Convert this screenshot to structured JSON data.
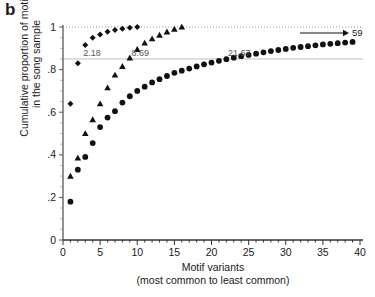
{
  "panel": {
    "label": "b"
  },
  "axes": {
    "ylabel_line1": "Cumulative proportion of motifs",
    "ylabel_line2": "in the song sample",
    "xlabel_line1": "Motif variants",
    "xlabel_line2": "(most common to least common)",
    "y_ticks": [
      "0",
      ".2",
      ".4",
      ".6",
      ".8",
      "1"
    ],
    "x_ticks": [
      "0",
      "5",
      "10",
      "15",
      "20",
      "25",
      "30",
      "35",
      "40"
    ]
  },
  "annotations": {
    "a1": "2.18",
    "a2": "8.69",
    "a3": "21.67",
    "arrow_label": "59"
  },
  "chart_data": {
    "type": "scatter",
    "title": "",
    "xlabel": "Motif variants (most common to least common)",
    "ylabel": "Cumulative proportion of motifs in the song sample",
    "xlim": [
      0,
      40
    ],
    "ylim": [
      0,
      1
    ],
    "x_major_ticks": [
      0,
      5,
      10,
      15,
      20,
      25,
      30,
      35,
      40
    ],
    "x_minor_tick_step": 1,
    "y_major_ticks": [
      0,
      0.2,
      0.4,
      0.6,
      0.8,
      1
    ],
    "grid": {
      "dotted_line_y": 1,
      "reference_line_y": 0.85
    },
    "legend": {
      "visible": false,
      "position": "none"
    },
    "annotations": [
      {
        "text": "2.18",
        "x": 2.18,
        "y": 0.85,
        "note": "variants needed to reach 85% cumulative, series 1"
      },
      {
        "text": "8.69",
        "x": 8.69,
        "y": 0.85,
        "note": "variants needed to reach 85% cumulative, series 2"
      },
      {
        "text": "21.67",
        "x": 21.67,
        "y": 0.85,
        "note": "variants needed to reach 85% cumulative, series 3"
      },
      {
        "text": "59",
        "x": 40,
        "y": 0.975,
        "note": "arrow pointing right, off-scale endpoint of series 3"
      }
    ],
    "series": [
      {
        "name": "Series 1",
        "marker": "diamond",
        "color": "#111111",
        "x": [
          1,
          2,
          3,
          4,
          5,
          6,
          7,
          8,
          9,
          10
        ],
        "y": [
          0.64,
          0.83,
          0.915,
          0.95,
          0.965,
          0.978,
          0.986,
          0.992,
          0.997,
          1.0
        ]
      },
      {
        "name": "Series 2",
        "marker": "triangle",
        "color": "#111111",
        "x": [
          1,
          2,
          3,
          4,
          5,
          6,
          7,
          8,
          9,
          10,
          11,
          12,
          13,
          14,
          15,
          16
        ],
        "y": [
          0.3,
          0.385,
          0.5,
          0.565,
          0.64,
          0.715,
          0.775,
          0.815,
          0.855,
          0.895,
          0.925,
          0.945,
          0.962,
          0.977,
          0.99,
          1.0
        ]
      },
      {
        "name": "Series 3",
        "marker": "circle",
        "color": "#111111",
        "x": [
          1,
          2,
          3,
          4,
          5,
          6,
          7,
          8,
          9,
          10,
          11,
          12,
          13,
          14,
          15,
          16,
          17,
          18,
          19,
          20,
          21,
          22,
          23,
          24,
          25,
          26,
          27,
          28,
          29,
          30,
          31,
          32,
          33,
          34,
          35,
          36,
          37,
          38,
          39
        ],
        "y": [
          0.18,
          0.33,
          0.39,
          0.455,
          0.53,
          0.575,
          0.605,
          0.645,
          0.675,
          0.7,
          0.72,
          0.74,
          0.755,
          0.77,
          0.785,
          0.795,
          0.805,
          0.815,
          0.825,
          0.833,
          0.841,
          0.849,
          0.856,
          0.863,
          0.869,
          0.875,
          0.881,
          0.887,
          0.892,
          0.897,
          0.902,
          0.906,
          0.91,
          0.914,
          0.918,
          0.921,
          0.924,
          0.927,
          0.93
        ]
      }
    ]
  }
}
